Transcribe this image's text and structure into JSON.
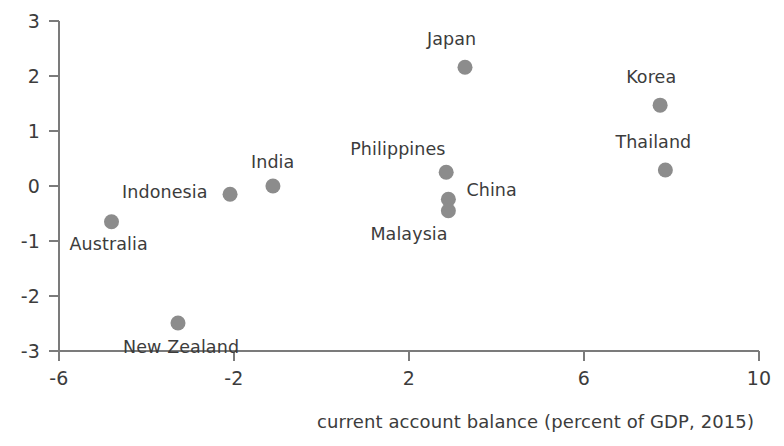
{
  "chart_data": {
    "type": "scatter",
    "title": "",
    "subtitle": "",
    "xlabel": "current account balance (percent of GDP, 2015)",
    "ylabel": "",
    "xlim": [
      -6,
      10
    ],
    "ylim": [
      -3,
      3
    ],
    "xticks": [
      -6,
      -2,
      2,
      6,
      10
    ],
    "xtick_labels": [
      "-6",
      "-2",
      "2",
      "6",
      "10"
    ],
    "yticks": [
      -3,
      -2,
      -1,
      0,
      1,
      2,
      3
    ],
    "ytick_labels": [
      "-3",
      "-2",
      "-1",
      "0",
      "1",
      "2",
      "3"
    ],
    "grid": false,
    "legend": null,
    "marker_color": "#8c8c8c",
    "axis_color": "#7b7b7b",
    "points": [
      {
        "label": "Australia",
        "x": -4.8,
        "y": -0.65,
        "label_dx": -42,
        "label_dy": 28
      },
      {
        "label": "New Zealand",
        "x": -3.28,
        "y": -2.49,
        "label_dx": -55,
        "label_dy": 30
      },
      {
        "label": "Indonesia",
        "x": -2.09,
        "y": -0.15,
        "label_dx": -108,
        "label_dy": 4
      },
      {
        "label": "India",
        "x": -1.11,
        "y": 0.0,
        "label_dx": -22,
        "label_dy": -18
      },
      {
        "label": "Philippines",
        "x": 2.85,
        "y": 0.25,
        "label_dx": -96,
        "label_dy": -17
      },
      {
        "label": "China",
        "x": 2.9,
        "y": -0.24,
        "label_dx": 18,
        "label_dy": -3
      },
      {
        "label": "Malaysia",
        "x": 2.9,
        "y": -0.45,
        "label_dx": -78,
        "label_dy": 29
      },
      {
        "label": "Japan",
        "x": 3.28,
        "y": 2.16,
        "label_dx": -38,
        "label_dy": -22
      },
      {
        "label": "Korea",
        "x": 7.74,
        "y": 1.47,
        "label_dx": -34,
        "label_dy": -22
      },
      {
        "label": "Thailand",
        "x": 7.86,
        "y": 0.29,
        "label_dx": -50,
        "label_dy": -22
      }
    ]
  },
  "axis": {
    "x_title": "current account balance (percent of GDP, 2015)"
  }
}
